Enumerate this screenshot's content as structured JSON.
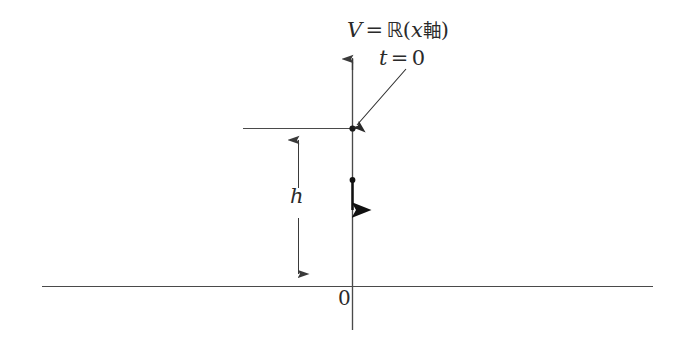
{
  "figure": {
    "background_color": "#ffffff",
    "ink_color": "#3a3a3a",
    "vector_color": "#1a1a1a",
    "labels": {
      "axis_label": {
        "full_text": "V = ℝ(x 軸)",
        "variable": "V",
        "equals": "=",
        "set": "ℝ",
        "open_paren": "(",
        "coordinate": "x",
        "kanji": "軸",
        "close_paren": ")"
      },
      "time_label": {
        "full_text": "t = 0",
        "variable": "t",
        "equals": "=",
        "value": "0"
      },
      "height_label": {
        "full_text": "h",
        "variable": "h"
      },
      "origin_label": {
        "full_text": "0",
        "value": "0"
      }
    },
    "geometry": {
      "vertical_axis": {
        "x": 352,
        "y_top": 48,
        "y_bottom": 330
      },
      "baseline": {
        "y": 286,
        "x_left": 42,
        "x_right": 653
      },
      "horizontal_tick_line": {
        "y": 128,
        "x_left": 243,
        "x_right": 357
      },
      "point_t0": {
        "x": 352,
        "y": 128
      },
      "vector": {
        "x": 352,
        "y_start": 180,
        "y_end": 227
      },
      "dimension_line": {
        "x": 298,
        "y_top": 128,
        "y_bottom": 286
      },
      "pointer_arrow": {
        "x_start": 406,
        "y_start": 69,
        "x_end": 356,
        "y_end": 126
      }
    }
  }
}
